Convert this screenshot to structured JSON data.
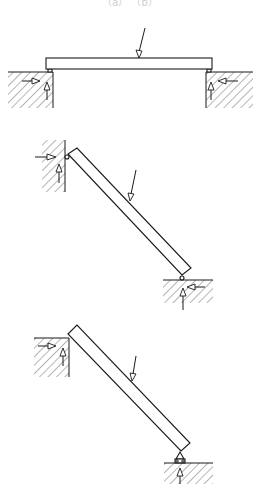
{
  "figure": {
    "caption_fragment": "（a）   （b）",
    "panels": [
      {
        "id": "panel-1",
        "description": "Horizontal beam simply supported on two ground blocks",
        "load_label": "F",
        "supports": [
          "left-block",
          "right-block"
        ],
        "reactions": [
          "horizontal",
          "vertical"
        ]
      },
      {
        "id": "panel-2",
        "description": "Inclined beam leaning against wall with ground support",
        "load_label": "F",
        "supports": [
          "wall",
          "ground"
        ],
        "reactions": [
          "horizontal",
          "vertical"
        ]
      },
      {
        "id": "panel-3",
        "description": "Inclined beam resting on block corner and pin support",
        "load_label": "F",
        "supports": [
          "block-corner",
          "pin"
        ],
        "reactions": [
          "horizontal",
          "vertical"
        ]
      }
    ]
  },
  "colors": {
    "line": "#1a1a1a",
    "background": "#ffffff"
  }
}
